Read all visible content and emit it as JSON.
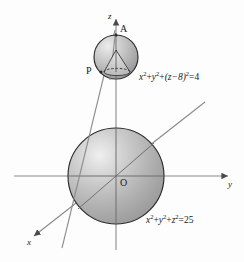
{
  "figure": {
    "background_color": "#fdfdfd",
    "axes": {
      "z": {
        "label": "z",
        "direction": "up",
        "arrow": true
      },
      "y": {
        "label": "y",
        "direction": "right",
        "arrow": true
      },
      "x": {
        "label": "x",
        "direction": "lower-left",
        "arrow": true
      }
    },
    "points": {
      "origin": "O",
      "apex": "A",
      "tangent_point": "P"
    },
    "equations": {
      "small_sphere": {
        "full": "x²+y²+(z−8)²=4",
        "var1": "x",
        "var2": "y",
        "expr": "(z−8)",
        "plus": "+",
        "equals": "=",
        "value": "4",
        "exp": "2"
      },
      "large_sphere": {
        "full": "x²+y²+z²=25",
        "var1": "x",
        "var2": "y",
        "var3": "z",
        "plus": "+",
        "equals": "=",
        "value": "25",
        "exp": "2"
      }
    },
    "colors": {
      "sphere_fill_light": "#e8e8e8",
      "sphere_fill_mid": "#b8b8b8",
      "sphere_fill_dark": "#8e8e8e",
      "outline": "#2b2b2b",
      "axis": "#777777",
      "line": "#808080",
      "text": "#1a1a1a"
    },
    "geometry": {
      "large_sphere": {
        "cx": 116,
        "cy": 176,
        "r": 48
      },
      "small_sphere": {
        "cx": 116,
        "cy": 57,
        "r": 22
      }
    }
  }
}
